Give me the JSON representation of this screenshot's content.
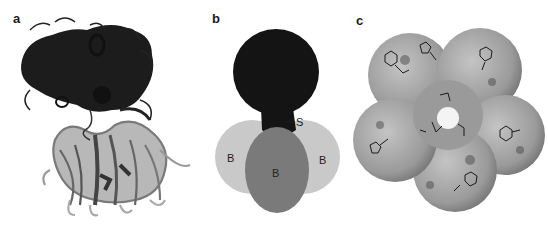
{
  "figure": {
    "panels": [
      {
        "id": "a",
        "label": "a",
        "description": "ribbon structure: dark upper domain above lighter gray lower barrel domain"
      },
      {
        "id": "b",
        "label": "b",
        "description": "schematic of domains",
        "annotations": {
          "S": "S",
          "B_left": "B",
          "B_right": "B",
          "B_center": "B"
        },
        "colors": {
          "top_domain": "#141414",
          "side_domains": "#c8c8c8",
          "center_domain": "#7a7a7a"
        }
      },
      {
        "id": "c",
        "label": "c",
        "description": "space-filling surface of ring-shaped assembly with central pore and stick ligands",
        "colors": {
          "surface": "#9a9a9a",
          "highlight": "#c4c4c4",
          "shadow": "#5a5a5a"
        }
      }
    ]
  }
}
